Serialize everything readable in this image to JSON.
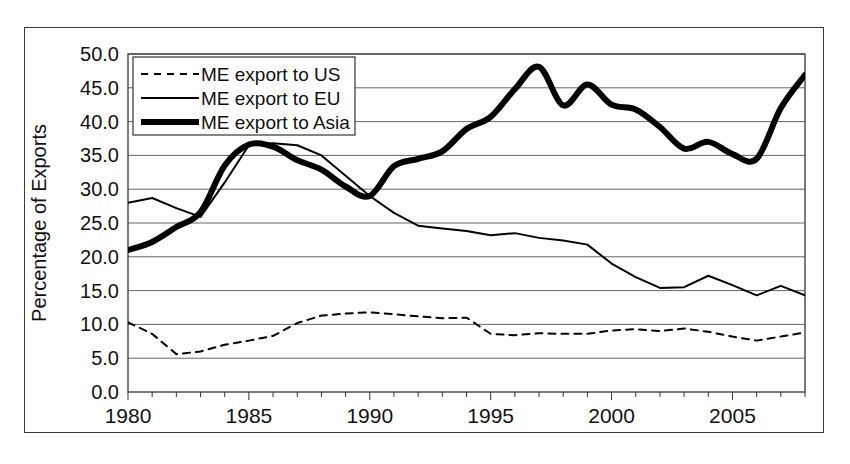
{
  "chart_data": {
    "type": "line",
    "title": "",
    "xlabel": "",
    "ylabel": "Percentage of Exports",
    "xlim": [
      1980,
      2008
    ],
    "ylim": [
      0.0,
      50.0
    ],
    "ytick_step": 5.0,
    "grid": true,
    "grid_axis": "y",
    "legend_position": "top-left",
    "x_tick_labels": [
      "1980",
      "1985",
      "1990",
      "1995",
      "2000",
      "2005"
    ],
    "x_tick_values": [
      1980,
      1985,
      1990,
      1995,
      2000,
      2005
    ],
    "x_minor_ticks_every": 1,
    "y_tick_labels": [
      "0.0",
      "5.0",
      "10.0",
      "15.0",
      "20.0",
      "25.0",
      "30.0",
      "35.0",
      "40.0",
      "45.0",
      "50.0"
    ],
    "y_tick_values": [
      0.0,
      5.0,
      10.0,
      15.0,
      20.0,
      25.0,
      30.0,
      35.0,
      40.0,
      45.0,
      50.0
    ],
    "x": [
      1980,
      1981,
      1982,
      1983,
      1984,
      1985,
      1986,
      1987,
      1988,
      1989,
      1990,
      1991,
      1992,
      1993,
      1994,
      1995,
      1996,
      1997,
      1998,
      1999,
      2000,
      2001,
      2002,
      2003,
      2004,
      2005,
      2006,
      2007,
      2008
    ],
    "series": [
      {
        "name": "ME export to US",
        "style": "dashed",
        "color": "#000000",
        "line_width": 2,
        "values": [
          10.3,
          8.6,
          5.6,
          6.0,
          7.0,
          7.6,
          8.3,
          10.2,
          11.3,
          11.6,
          11.8,
          11.5,
          11.2,
          10.9,
          11.0,
          8.6,
          8.4,
          8.7,
          8.6,
          8.6,
          9.1,
          9.3,
          9.0,
          9.4,
          8.9,
          8.2,
          7.6,
          8.2,
          8.8
        ]
      },
      {
        "name": "ME export to EU",
        "style": "solid",
        "color": "#000000",
        "line_width": 2,
        "values": [
          28.0,
          28.7,
          27.2,
          25.9,
          31.0,
          36.5,
          36.8,
          36.5,
          35.0,
          32.0,
          29.0,
          26.5,
          24.6,
          24.2,
          23.8,
          23.2,
          23.5,
          22.8,
          22.4,
          21.8,
          19.0,
          17.0,
          15.4,
          15.5,
          17.2,
          15.8,
          14.3,
          15.7,
          14.3
        ]
      },
      {
        "name": "ME export to Asia",
        "style": "solid-bold",
        "color": "#000000",
        "line_width": 6,
        "values": [
          21.0,
          22.2,
          24.4,
          26.6,
          33.5,
          36.6,
          36.3,
          34.3,
          32.9,
          30.4,
          29.0,
          33.4,
          34.5,
          35.6,
          38.9,
          40.7,
          44.8,
          48.1,
          42.4,
          45.5,
          42.5,
          41.8,
          39.2,
          36.0,
          37.0,
          35.2,
          34.5,
          42.0,
          46.9
        ]
      }
    ],
    "legend": [
      {
        "label": "ME export to US",
        "style": "dashed"
      },
      {
        "label": "ME export to EU",
        "style": "solid"
      },
      {
        "label": "ME export to Asia",
        "style": "solid-bold"
      }
    ]
  }
}
